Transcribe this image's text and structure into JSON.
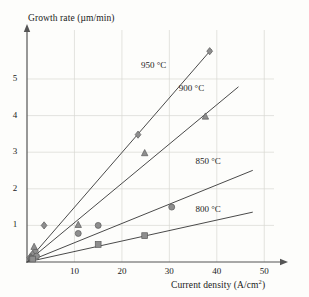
{
  "chart_data": {
    "type": "scatter",
    "title": "",
    "xlabel": "Current density (A/cm2)",
    "xlabel_base": "Current density (A/cm",
    "xlabel_sup": "2",
    "xlabel_close": ")",
    "ylabel": "Growth rate (µm/min)",
    "xlim": [
      0,
      55
    ],
    "ylim": [
      0,
      6.0
    ],
    "xticks": [
      10,
      20,
      30,
      40,
      50
    ],
    "yticks": [
      1,
      2,
      3,
      4,
      5
    ],
    "xtick_labels": [
      "10",
      "20",
      "30",
      "40",
      "50"
    ],
    "ytick_labels": [
      "1",
      "2",
      "3",
      "4",
      "5"
    ],
    "grid": true,
    "grid_color": "#d8d8d2",
    "axis_color": "#555555",
    "line_color": "#4a4a4a",
    "marker_color": "#8e8e8e",
    "marker_edge_color": "#5a5a5a",
    "legend_position": "inline-annotations",
    "series": [
      {
        "name": "950 °C",
        "label": "950 °C",
        "marker": "diamond",
        "slope": 0.1494,
        "fit_x": [
          0,
          38.8
        ],
        "fit_y": [
          0.0,
          5.8
        ],
        "label_x": 24.0,
        "label_y": 5.35,
        "points": [
          {
            "x": 0.6,
            "y": 0.12
          },
          {
            "x": 1.2,
            "y": 0.22
          },
          {
            "x": 1.8,
            "y": 0.3
          },
          {
            "x": 3.6,
            "y": 1.0
          },
          {
            "x": 23.4,
            "y": 3.48
          },
          {
            "x": 38.5,
            "y": 5.76
          }
        ]
      },
      {
        "name": "900 °C",
        "label": "900 °C",
        "marker": "triangle",
        "slope": 0.1073,
        "fit_x": [
          0,
          44.5
        ],
        "fit_y": [
          0.0,
          4.78
        ],
        "label_x": 32.0,
        "label_y": 4.72,
        "points": [
          {
            "x": 0.8,
            "y": 0.14
          },
          {
            "x": 1.5,
            "y": 0.42
          },
          {
            "x": 10.8,
            "y": 1.02
          },
          {
            "x": 24.8,
            "y": 2.98
          },
          {
            "x": 37.6,
            "y": 3.98
          }
        ]
      },
      {
        "name": "850 °C",
        "label": "850 °C",
        "marker": "circle",
        "slope": 0.0525,
        "fit_x": [
          0,
          47.5
        ],
        "fit_y": [
          0.0,
          2.5
        ],
        "label_x": 35.5,
        "label_y": 2.72,
        "points": [
          {
            "x": 1.0,
            "y": 0.1
          },
          {
            "x": 2.0,
            "y": 0.16
          },
          {
            "x": 10.8,
            "y": 0.78
          },
          {
            "x": 15.0,
            "y": 1.0
          },
          {
            "x": 30.5,
            "y": 1.5
          }
        ]
      },
      {
        "name": "800 °C",
        "label": "800 °C",
        "marker": "square",
        "slope": 0.0286,
        "fit_x": [
          0,
          47.5
        ],
        "fit_y": [
          0.0,
          1.36
        ],
        "label_x": 35.5,
        "label_y": 1.42,
        "points": [
          {
            "x": 1.2,
            "y": 0.08
          },
          {
            "x": 15.0,
            "y": 0.48
          },
          {
            "x": 24.8,
            "y": 0.72
          }
        ]
      }
    ]
  }
}
